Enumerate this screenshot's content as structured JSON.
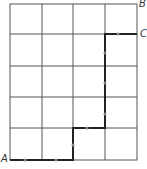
{
  "diagram": {
    "type": "grid-path",
    "grid": {
      "columns": 4,
      "rows": 5
    },
    "labels": {
      "A": "A",
      "B": "B",
      "C": "C"
    },
    "path": [
      [
        0,
        0
      ],
      [
        2,
        0
      ],
      [
        2,
        1
      ],
      [
        3,
        1
      ],
      [
        3,
        4
      ],
      [
        4,
        4
      ]
    ],
    "colors": {
      "grid": "#555555",
      "path": "#222222",
      "arrow": "#888888"
    }
  }
}
